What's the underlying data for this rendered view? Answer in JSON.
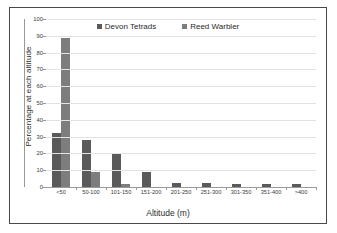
{
  "chart_data": {
    "type": "bar",
    "title": "",
    "xlabel": "Altitude (m)",
    "ylabel": "Percentage at each altitude",
    "ylim": [
      0,
      100
    ],
    "ytick_step": 10,
    "grid": true,
    "legend_position": "top-center",
    "categories": [
      "<50",
      "50-100",
      "101-150",
      "151-200",
      "201-250",
      "251-300",
      "301-350",
      "351-400",
      ">400"
    ],
    "yticks": [
      "0",
      "10",
      "20",
      "30",
      "40",
      "50",
      "60",
      "70",
      "80",
      "90",
      "100"
    ],
    "series": [
      {
        "name": "Devon Tetrads",
        "color": "#5a5a5a",
        "values": [
          32,
          28,
          20,
          9,
          2.5,
          2.5,
          2,
          1.5,
          1.5
        ]
      },
      {
        "name": "Reed Warbler",
        "color": "#7d7d7d",
        "values": [
          88.5,
          9,
          2,
          0,
          0,
          0,
          0,
          0,
          0
        ]
      }
    ]
  }
}
